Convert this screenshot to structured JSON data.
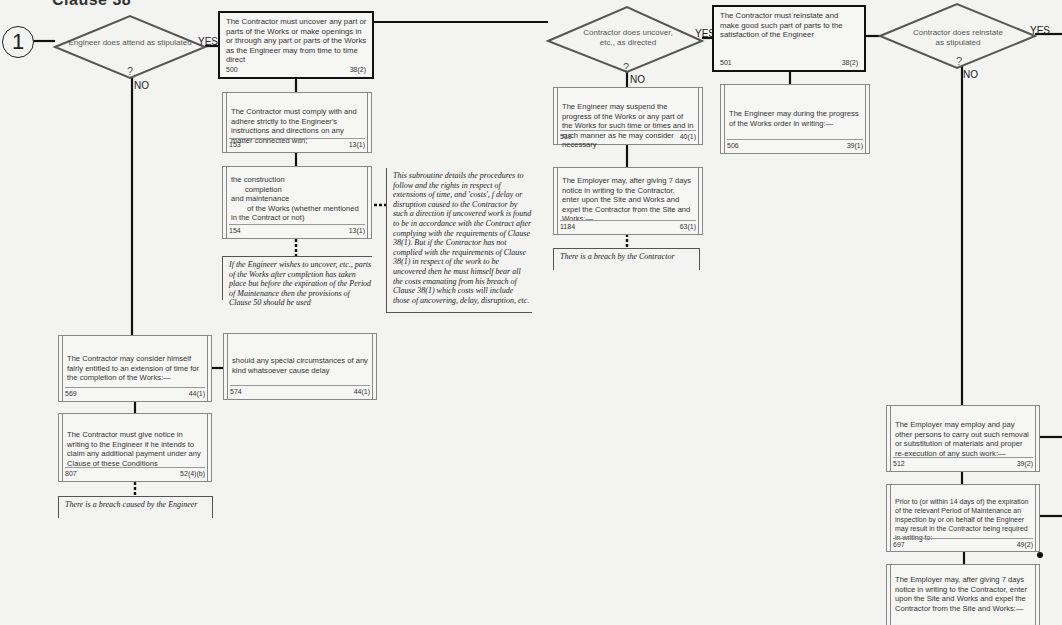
{
  "heading": "Clause 38",
  "start": {
    "label": "1"
  },
  "decisions": [
    {
      "id": "d1",
      "text": "Engineer does attend as stipulated",
      "yes": "YES",
      "no": "NO",
      "q": "?"
    },
    {
      "id": "d2",
      "text": "Contractor does uncover, etc., as directed",
      "yes": "YES",
      "no": "NO",
      "q": "?"
    },
    {
      "id": "d3",
      "text": "Contractor does reinstate as stipulated",
      "yes": "YES",
      "no": "NO",
      "q": "?"
    }
  ],
  "boxes": {
    "b500": {
      "text": "The Contractor must uncover any part or parts of the Works or make openings in or through any part or parts of the Works as the Engineer may from time to time direct",
      "num": "500",
      "clause": "38(2)"
    },
    "b153": {
      "text": "The Contractor must comply with and adhere strictly to the Engineer's instructions and directions on any matter connected with;",
      "num": "153",
      "clause": "13(1)"
    },
    "b154": {
      "lines": [
        "the construction",
        "completion",
        "and maintenance",
        "of the Works (whether mentioned",
        "in the Contract or not)"
      ],
      "num": "154",
      "clause": "13(1)"
    },
    "b519": {
      "text": "The Engineer may suspend the progress of the Works or any part of the Works for such time or times and in such manner as he may consider necessary",
      "num": "519",
      "clause": "40(1)"
    },
    "b1184": {
      "text": "The Employer may, after giving 7 days notice in writing to the Contractor, enter upon the Site and Works and expel the Contractor from the Site and Works:—",
      "num": "1184",
      "clause": "63(1)"
    },
    "b501": {
      "text": "The Contractor must reinstate and make good such part of parts to the satisfaction of the Engineer",
      "num": "501",
      "clause": "38(2)"
    },
    "b506": {
      "text": "The Engineer may during the progress of the Works order in writing:—",
      "num": "506",
      "clause": "39(1)"
    },
    "b569": {
      "text": "The Contractor may consider himself fairly entitled to an extension of time for the completion of the Works:—",
      "num": "569",
      "clause": "44(1)"
    },
    "b574": {
      "text": "should any special circumstances of any kind whatsoever cause delay",
      "num": "574",
      "clause": "44(1)"
    },
    "b807": {
      "text": "The Contractor must give notice in writing to the Engineer if he intends to claim any additional payment under any Clause of these Conditions",
      "num": "807",
      "clause": "52(4)(b)"
    },
    "b512": {
      "text": "The Employer may employ and pay other persons to carry out such removal or substitution of materials and proper re-execution of any such work:—",
      "num": "512",
      "clause": "39(2)"
    },
    "b697": {
      "text": "Prior to (or within 14 days of) the expiration of the relevant Period of Maintenance an inspection by or on behalf of the Engineer may result in the Contractor being required in writing to:—",
      "num": "697",
      "clause": "49(2)"
    },
    "b1184b": {
      "text": "The Employer may, after giving 7 days notice in writing to the Contractor, enter upon the Site and Works and expel the Contractor from the Site and Works:—"
    }
  },
  "notes": {
    "subroutine": "This subroutine details the procedures to follow and the rights in respect of extensions of time, and 'costs', f delay or disruption caused to the Contractor by such a direction if uncovered work is found to be in accordance with the Contract after complying with the requirements of Clause 38(1). But if the Contractor has not complied with the requirements of Clause 38(1) in respect of the work to be uncovered then he must himself bear all the costs emanating from his breach of Clause 38(1) which costs will include those of uncovering, delay, disruption, etc.",
    "after_completion": "If the Engineer wishes to uncover, etc., parts of the Works after completion has taken place but before the expiration of the Period of Maintenance then the provisions of Clause 50 should be used",
    "breach_contractor": "There is a breach by the Contractor",
    "breach_engineer": "There is a breach caused by the Engineer"
  }
}
